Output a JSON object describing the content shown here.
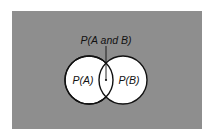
{
  "diagram": {
    "type": "venn",
    "background_color": "#8e8e8e",
    "circle_fill": "#ffffff",
    "circle_stroke": "#111111",
    "labels": {
      "intersection": "P(A and B)",
      "set_a": "P(A)",
      "set_b": "P(B)"
    }
  }
}
